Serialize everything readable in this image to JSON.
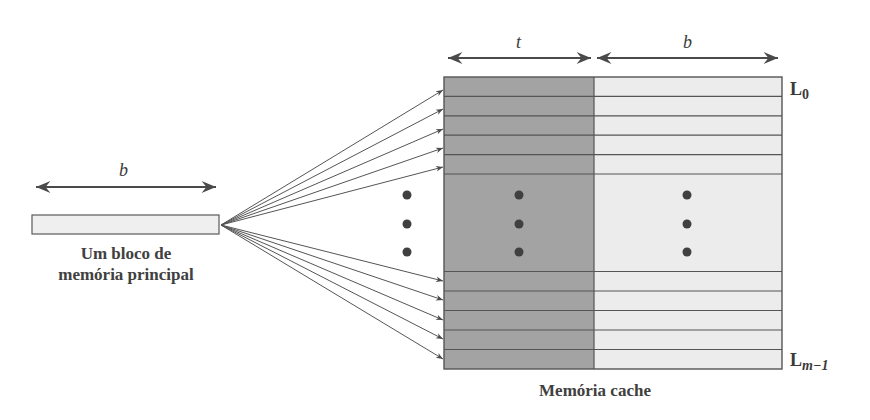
{
  "main_memory": {
    "width_label": "b",
    "caption_line1": "Um bloco de",
    "caption_line2": "memória principal"
  },
  "cache": {
    "tag_width_label": "t",
    "block_width_label": "b",
    "first_line_label": "L",
    "first_line_sub": "0",
    "last_line_label": "L",
    "last_line_sub": "m−1",
    "caption": "Memória cache",
    "top_rows": 5,
    "bottom_rows": 5
  },
  "colors": {
    "tag_fill": "#a3a3a3",
    "block_fill": "#ececec",
    "line": "#555555",
    "dot": "#404040"
  }
}
